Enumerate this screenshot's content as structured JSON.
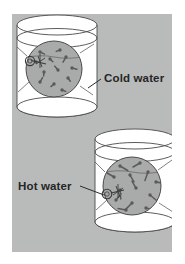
{
  "figure": {
    "background_color": "#ffffff",
    "panel_color": "#b9bbbb",
    "beaker_fill": "#ffffff",
    "outline_color": "#4a4a4a",
    "lens_fill": "#a9abab",
    "molecule_color": "#5a5a5a",
    "label_color": "#262626"
  },
  "panel": {
    "x": 12,
    "y": 14,
    "width": 160,
    "height": 238
  },
  "labels": [
    {
      "id": "cold-water",
      "text": "Cold water",
      "x": 104,
      "y": 82,
      "anchor": "start",
      "leader": "M 88 88 L 101 79"
    },
    {
      "id": "hot-water",
      "text": "Hot water",
      "x": 18,
      "y": 190,
      "anchor": "start",
      "leader": "M 80 186 L 104 195"
    }
  ],
  "beakers": [
    {
      "id": "cold-beaker",
      "name": "beaker-cold-water",
      "cx": 57,
      "rim_y": 25,
      "base_y": 107,
      "rx": 40,
      "ry": 10,
      "water_y": 38,
      "lens": {
        "cx": 54,
        "cy": 69,
        "r": 28,
        "handle_angle": 208,
        "water_line_y": 57
      },
      "molecule_speed": "slow",
      "molecule_count": 12
    },
    {
      "id": "hot-beaker",
      "name": "beaker-hot-water",
      "cx": 135,
      "rim_y": 139,
      "base_y": 222,
      "rx": 40,
      "ry": 10,
      "water_y": 152,
      "lens": {
        "cx": 132,
        "cy": 186,
        "r": 29,
        "handle_angle": 205,
        "water_line_y": 172
      },
      "molecule_speed": "fast",
      "molecule_count": 13
    }
  ],
  "molecules": {
    "cold": [
      {
        "x": 40,
        "y": 52,
        "a": 25,
        "len": 5
      },
      {
        "x": 60,
        "y": 50,
        "a": 160,
        "len": 4
      },
      {
        "x": 36,
        "y": 62,
        "a": 200,
        "len": 5
      },
      {
        "x": 50,
        "y": 59,
        "a": 45,
        "len": 4
      },
      {
        "x": 66,
        "y": 57,
        "a": 120,
        "len": 6
      },
      {
        "x": 72,
        "y": 68,
        "a": 15,
        "len": 5
      },
      {
        "x": 44,
        "y": 72,
        "a": 95,
        "len": 4
      },
      {
        "x": 58,
        "y": 70,
        "a": 230,
        "len": 5
      },
      {
        "x": 68,
        "y": 78,
        "a": 55,
        "len": 4
      },
      {
        "x": 40,
        "y": 82,
        "a": 300,
        "len": 5
      },
      {
        "x": 54,
        "y": 84,
        "a": 140,
        "len": 4
      },
      {
        "x": 62,
        "y": 90,
        "a": 20,
        "len": 4
      }
    ],
    "hot": [
      {
        "x": 120,
        "y": 166,
        "a": 30,
        "len": 9
      },
      {
        "x": 140,
        "y": 163,
        "a": 150,
        "len": 8
      },
      {
        "x": 114,
        "y": 177,
        "a": 210,
        "len": 9
      },
      {
        "x": 130,
        "y": 175,
        "a": 60,
        "len": 8
      },
      {
        "x": 148,
        "y": 172,
        "a": 110,
        "len": 9
      },
      {
        "x": 156,
        "y": 182,
        "a": 10,
        "len": 8
      },
      {
        "x": 120,
        "y": 190,
        "a": 85,
        "len": 9
      },
      {
        "x": 136,
        "y": 188,
        "a": 240,
        "len": 8
      },
      {
        "x": 150,
        "y": 195,
        "a": 40,
        "len": 9
      },
      {
        "x": 116,
        "y": 200,
        "a": 310,
        "len": 8
      },
      {
        "x": 132,
        "y": 203,
        "a": 135,
        "len": 9
      },
      {
        "x": 146,
        "y": 208,
        "a": 15,
        "len": 8
      },
      {
        "x": 126,
        "y": 210,
        "a": 190,
        "len": 8
      }
    ]
  }
}
